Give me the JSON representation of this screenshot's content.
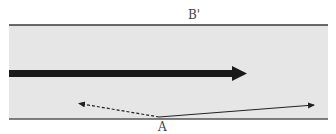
{
  "diagram": {
    "labels": {
      "top": "B'",
      "bottom": "A"
    },
    "colors": {
      "channel_fill": "#e6e6e6",
      "boundary": "#3a3a3a",
      "thick_arrow": "#1a1a1a",
      "thin_arrow": "#222222",
      "label": "#444444"
    },
    "elements": [
      {
        "type": "boundary-line",
        "position": "top"
      },
      {
        "type": "boundary-line",
        "position": "bottom"
      },
      {
        "type": "thick-arrow",
        "direction": "right"
      },
      {
        "type": "dashed-arrow",
        "from": "A",
        "direction": "up-left"
      },
      {
        "type": "solid-arrow",
        "from": "A",
        "direction": "up-right"
      }
    ]
  }
}
